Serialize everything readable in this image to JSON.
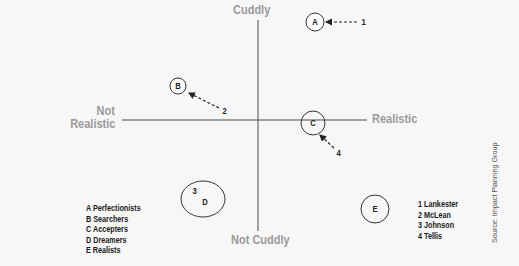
{
  "axes": {
    "top": "Cuddly",
    "bottom": "Not Cuddly",
    "left_line1": "Not",
    "left_line2": "Realistic",
    "right": "Realistic"
  },
  "nodes": [
    {
      "id": "A",
      "label": "A",
      "x": 315,
      "y": 22,
      "rx": 9,
      "ry": 9
    },
    {
      "id": "B",
      "label": "B",
      "x": 178,
      "y": 86,
      "rx": 8,
      "ry": 8
    },
    {
      "id": "C",
      "label": "C",
      "x": 313,
      "y": 123,
      "rx": 12,
      "ry": 12
    },
    {
      "id": "D",
      "label": "D",
      "x": 203,
      "y": 199,
      "rx": 22,
      "ry": 18
    },
    {
      "id": "E",
      "label": "E",
      "x": 375,
      "y": 209,
      "rx": 14,
      "ry": 14
    }
  ],
  "numbers": [
    {
      "id": "1",
      "label": "1",
      "x": 361,
      "y": 17
    },
    {
      "id": "2",
      "label": "2",
      "x": 223,
      "y": 107
    },
    {
      "id": "3",
      "label": "3",
      "x": 192,
      "y": 188
    },
    {
      "id": "4",
      "label": "4",
      "x": 336,
      "y": 149
    }
  ],
  "legend_groups": {
    "items": [
      "A Perfectionists",
      "B Searchers",
      "C Accepters",
      "D Dreamers",
      "E Realists"
    ]
  },
  "legend_people": {
    "items": [
      "1 Lankester",
      "2 McLean",
      "3 Johnson",
      "4 Tellis"
    ]
  },
  "source": "Source: Impact Planning Group",
  "colors": {
    "background": "#f7f7f7",
    "axis_line": "#4a4a4a",
    "axis_label": "#9a9a9a",
    "text": "#1a1a1a"
  }
}
